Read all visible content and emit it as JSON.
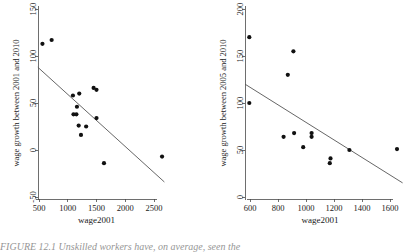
{
  "figure": {
    "caption": "FIGURE 12.1 Unskilled workers have, on average, seen the"
  },
  "chart_data": [
    {
      "type": "scatter",
      "panel": "left",
      "title": "",
      "xlabel": "wage2001",
      "ylabel": "wage growth between 2001 and 2010",
      "xlim": [
        420,
        2720
      ],
      "ylim": [
        -50,
        150
      ],
      "xticks": [
        500,
        1000,
        1500,
        2000,
        2500
      ],
      "yticks": [
        -50,
        0,
        50,
        100,
        150
      ],
      "grid": false,
      "legend": "none",
      "x": [
        560,
        720,
        1090,
        1100,
        1150,
        1160,
        1200,
        1190,
        1230,
        1320,
        1450,
        1500,
        1500,
        1630,
        2640
      ],
      "y": [
        113,
        117,
        58,
        38,
        38,
        46,
        60,
        26,
        16,
        25,
        66,
        64,
        34,
        -14,
        -7
      ],
      "trend_line": {
        "x": [
          480,
          2680
        ],
        "y": [
          88,
          -34
        ]
      }
    },
    {
      "type": "scatter",
      "panel": "right",
      "title": "",
      "xlabel": "wage2001",
      "ylabel": "wage growth between 2005 and 2010",
      "xlim": [
        540,
        1700
      ],
      "ylim": [
        0,
        200
      ],
      "xticks": [
        600,
        800,
        1000,
        1200,
        1400,
        1600
      ],
      "yticks": [
        0,
        50,
        100,
        150,
        200
      ],
      "grid": false,
      "legend": "none",
      "x": [
        595,
        595,
        840,
        870,
        910,
        915,
        980,
        1040,
        1040,
        1170,
        1175,
        1310,
        1650
      ],
      "y": [
        170,
        100,
        64,
        130,
        155,
        68,
        53,
        68,
        64,
        36,
        41,
        50,
        51
      ],
      "trend_line": {
        "x": [
          565,
          1690
        ],
        "y": [
          120,
          15
        ]
      }
    }
  ]
}
